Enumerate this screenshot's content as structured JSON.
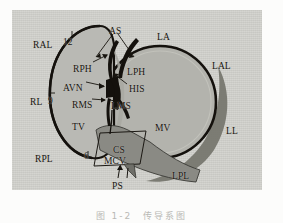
{
  "figure": {
    "type": "anatomical-diagram",
    "palette": {
      "page_background": "#fcfcfb",
      "plate_background": "#d2d2cd",
      "annulus_fill": "#b7b7b2",
      "annulus_fill_dark": "#8f8f8a",
      "shadow_crescent": "#6f6f6a",
      "ink": "#17140f",
      "conduction_black": "#14110d"
    },
    "caption": "图 1-2　传导系图"
  },
  "labels": [
    {
      "id": "RAL",
      "text": "RAL",
      "x": 33,
      "y": 41,
      "kind": "abbrev",
      "meaning": "right anterolateral"
    },
    {
      "id": "AS",
      "text": "AS",
      "x": 109,
      "y": 27,
      "kind": "abbrev",
      "meaning": "atrial septum"
    },
    {
      "id": "LA",
      "text": "LA",
      "x": 157,
      "y": 33,
      "kind": "abbrev",
      "meaning": "left anterior"
    },
    {
      "id": "LAL",
      "text": "LAL",
      "x": 212,
      "y": 62,
      "kind": "abbrev",
      "meaning": "left anterolateral"
    },
    {
      "id": "RPH",
      "text": "RPH",
      "x": 73,
      "y": 65,
      "kind": "abbrev",
      "meaning": "right posterior His"
    },
    {
      "id": "LPH",
      "text": "LPH",
      "x": 127,
      "y": 68,
      "kind": "abbrev",
      "meaning": "left posterior His"
    },
    {
      "id": "AVN",
      "text": "AVN",
      "x": 63,
      "y": 84,
      "kind": "abbrev",
      "meaning": "atrioventricular node"
    },
    {
      "id": "HIS",
      "text": "HIS",
      "x": 129,
      "y": 85,
      "kind": "abbrev",
      "meaning": "bundle of His"
    },
    {
      "id": "RMS",
      "text": "RMS",
      "x": 72,
      "y": 101,
      "kind": "abbrev",
      "meaning": "right midseptal"
    },
    {
      "id": "LMS",
      "text": "LMS",
      "x": 111,
      "y": 102,
      "kind": "abbrev",
      "meaning": "left midseptal"
    },
    {
      "id": "RL",
      "text": "RL",
      "x": 30,
      "y": 98,
      "kind": "abbrev",
      "meaning": "right lateral"
    },
    {
      "id": "TV",
      "text": "TV",
      "x": 72,
      "y": 123,
      "kind": "abbrev",
      "meaning": "tricuspid valve annulus"
    },
    {
      "id": "MV",
      "text": "MV",
      "x": 155,
      "y": 124,
      "kind": "abbrev",
      "meaning": "mitral valve annulus"
    },
    {
      "id": "LL",
      "text": "LL",
      "x": 226,
      "y": 127,
      "kind": "abbrev",
      "meaning": "left lateral"
    },
    {
      "id": "RPL",
      "text": "RPL",
      "x": 35,
      "y": 155,
      "kind": "abbrev",
      "meaning": "right posterolateral"
    },
    {
      "id": "CS",
      "text": "CS",
      "x": 113,
      "y": 146,
      "kind": "abbrev",
      "meaning": "coronary sinus"
    },
    {
      "id": "MCV",
      "text": "MCV",
      "x": 108,
      "y": 157,
      "kind": "abbrev",
      "meaning": "middle cardiac vein"
    },
    {
      "id": "PS",
      "text": "PS",
      "x": 112,
      "y": 182,
      "kind": "abbrev",
      "meaning": "posteroseptal"
    },
    {
      "id": "LPL",
      "text": "LPL",
      "x": 172,
      "y": 172,
      "kind": "abbrev",
      "meaning": "left posterolateral"
    }
  ],
  "clock_markers": [
    {
      "id": "12",
      "text": "12",
      "x": 63,
      "y": 38
    },
    {
      "id": "9",
      "text": "9",
      "x": 48,
      "y": 97
    },
    {
      "id": "6",
      "text": "6",
      "x": 84,
      "y": 152
    }
  ]
}
